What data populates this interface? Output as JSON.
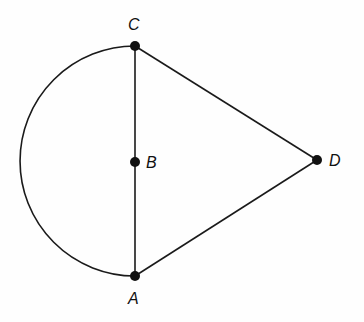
{
  "diagram": {
    "type": "geometry",
    "points": [
      {
        "label": "C",
        "x": 135,
        "y": 46,
        "lx": 128,
        "ly": 30
      },
      {
        "label": "B",
        "x": 135,
        "y": 162,
        "lx": 146,
        "ly": 168
      },
      {
        "label": "A",
        "x": 135,
        "y": 276,
        "lx": 128,
        "ly": 304
      },
      {
        "label": "D",
        "x": 317,
        "y": 160,
        "lx": 329,
        "ly": 166
      }
    ],
    "segments": [
      [
        "C",
        "A"
      ],
      [
        "C",
        "D"
      ],
      [
        "A",
        "D"
      ]
    ],
    "arcs": [
      {
        "from": "C",
        "to": "A",
        "center": "B",
        "side": "left",
        "kind": "semicircle"
      }
    ],
    "stroke_color": "#1a1a1a"
  }
}
